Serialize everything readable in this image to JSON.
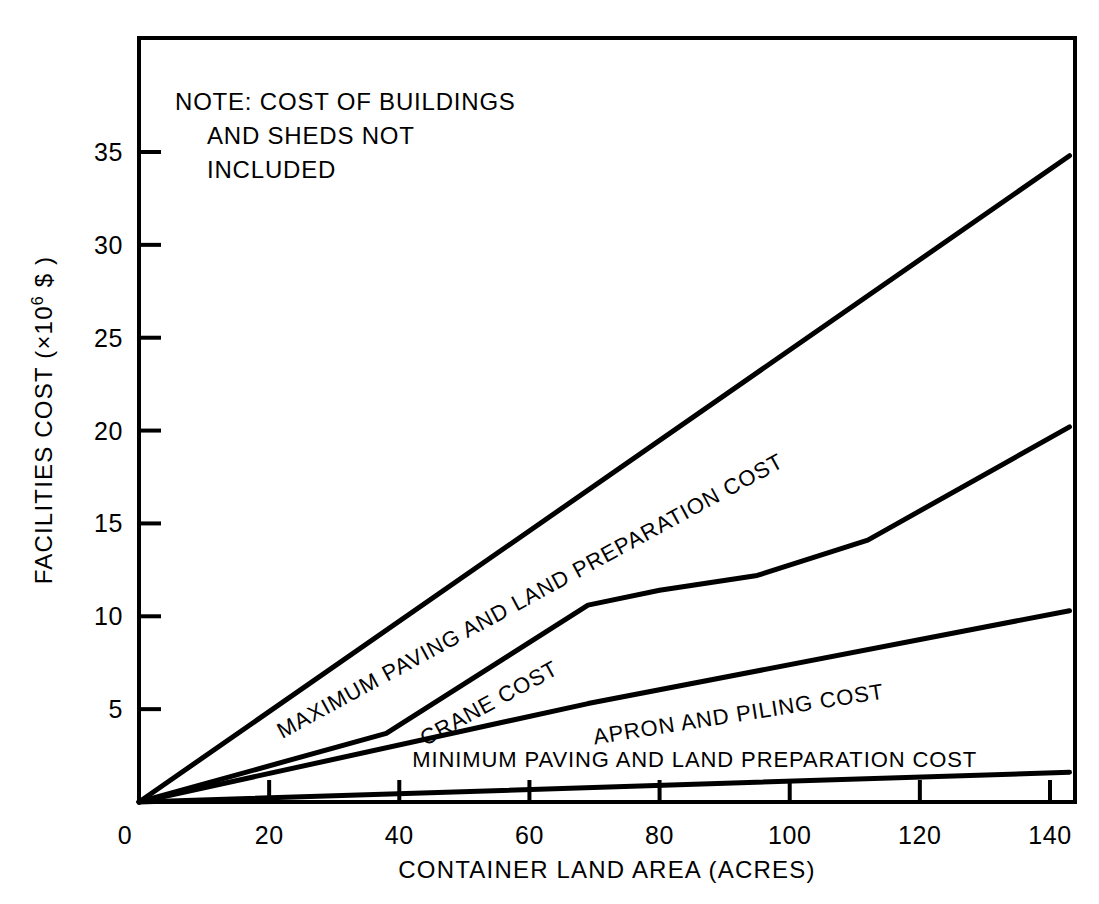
{
  "chart_data": {
    "type": "line",
    "title": "",
    "xlabel": "CONTAINER LAND AREA (ACRES)",
    "ylabel": "FACILITIES COST (×10⁶ $)",
    "ylabel_parts": {
      "pre": "FACILITIES COST (×10",
      "sup": "6",
      "post": " $ )"
    },
    "xlim": [
      0,
      143
    ],
    "ylim": [
      0,
      39
    ],
    "xticks": [
      0,
      20,
      40,
      60,
      80,
      100,
      120,
      140
    ],
    "xtick_labels": [
      "0",
      "20",
      "40",
      "60",
      "80",
      "100",
      "120",
      "140"
    ],
    "yticks": [
      5,
      10,
      15,
      20,
      25,
      30,
      35
    ],
    "ytick_labels": [
      "5",
      "10",
      "15",
      "20",
      "25",
      "30",
      "35"
    ],
    "ytick_zero_label": "0",
    "grid": false,
    "legend_position": "inline-on-curve",
    "note": {
      "lines": [
        "NOTE: COST OF BUILDINGS",
        "AND SHEDS NOT",
        "INCLUDED"
      ]
    },
    "series": [
      {
        "name": "MAXIMUM PAVING AND LAND PREPARATION COST",
        "label": "MAXIMUM PAVING AND LAND PREPARATION COST",
        "label_rotation": -28.5,
        "label_anchor_x": 22,
        "label_anchor_y": 3.4,
        "color": "#000000",
        "x": [
          0,
          143
        ],
        "y": [
          0,
          34.8
        ]
      },
      {
        "name": "CRANE COST",
        "label": "CRANE COST",
        "label_rotation": -28.5,
        "label_anchor_x": 44,
        "label_anchor_y": 3.0,
        "color": "#000000",
        "x": [
          0,
          38,
          69,
          80,
          95,
          112,
          143
        ],
        "y": [
          0,
          3.7,
          10.6,
          11.4,
          12.2,
          14.1,
          20.2
        ]
      },
      {
        "name": "APRON AND PILING COST",
        "label": "APRON AND PILING COST",
        "label_rotation": -9.0,
        "label_anchor_x": 70,
        "label_anchor_y": 3.1,
        "color": "#000000",
        "x": [
          0,
          69,
          143
        ],
        "y": [
          0,
          5.3,
          10.3
        ]
      },
      {
        "name": "MINIMUM PAVING AND LAND PREPARATION COST",
        "label": "MINIMUM PAVING AND LAND PREPARATION COST",
        "label_rotation": 0,
        "label_anchor_x": 42,
        "label_anchor_y": 1.9,
        "color": "#000000",
        "x": [
          0,
          143
        ],
        "y": [
          0,
          1.6
        ]
      }
    ]
  }
}
